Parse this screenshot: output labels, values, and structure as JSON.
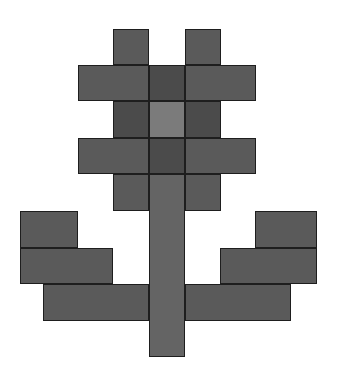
{
  "figure": {
    "background": "#ffffff",
    "colors": {
      "standard": "#5a5a5a",
      "dark": "#4b4b4b",
      "light_center": "#7b7b7b",
      "stem": "#646464",
      "outline": "#1e1e1e"
    },
    "blocks": [
      {
        "name": "petal-top-left",
        "x": 113,
        "y": 29,
        "w": 36,
        "h": 36,
        "tone": "standard"
      },
      {
        "name": "petal-top-right",
        "x": 185,
        "y": 29,
        "w": 36,
        "h": 36,
        "tone": "standard"
      },
      {
        "name": "petal-upper-left",
        "x": 78,
        "y": 65,
        "w": 71,
        "h": 36,
        "tone": "standard"
      },
      {
        "name": "petal-upper-center",
        "x": 149,
        "y": 65,
        "w": 36,
        "h": 36,
        "tone": "dark"
      },
      {
        "name": "petal-upper-right",
        "x": 185,
        "y": 65,
        "w": 71,
        "h": 36,
        "tone": "standard"
      },
      {
        "name": "petal-mid-left",
        "x": 113,
        "y": 101,
        "w": 36,
        "h": 37,
        "tone": "dark"
      },
      {
        "name": "flower-center",
        "x": 149,
        "y": 101,
        "w": 36,
        "h": 37,
        "tone": "light_center"
      },
      {
        "name": "petal-mid-right",
        "x": 185,
        "y": 101,
        "w": 36,
        "h": 37,
        "tone": "dark"
      },
      {
        "name": "petal-lower-left",
        "x": 78,
        "y": 138,
        "w": 71,
        "h": 36,
        "tone": "standard"
      },
      {
        "name": "petal-lower-center",
        "x": 149,
        "y": 138,
        "w": 36,
        "h": 36,
        "tone": "dark"
      },
      {
        "name": "petal-lower-right",
        "x": 185,
        "y": 138,
        "w": 71,
        "h": 36,
        "tone": "standard"
      },
      {
        "name": "petal-bottom-left",
        "x": 113,
        "y": 174,
        "w": 36,
        "h": 37,
        "tone": "standard"
      },
      {
        "name": "petal-bottom-right",
        "x": 185,
        "y": 174,
        "w": 36,
        "h": 37,
        "tone": "standard"
      },
      {
        "name": "stem",
        "x": 149,
        "y": 174,
        "w": 36,
        "h": 183,
        "tone": "stem"
      },
      {
        "name": "leaf-left-top",
        "x": 20,
        "y": 211,
        "w": 58,
        "h": 37,
        "tone": "standard"
      },
      {
        "name": "leaf-left-middle",
        "x": 20,
        "y": 248,
        "w": 93,
        "h": 36,
        "tone": "standard"
      },
      {
        "name": "leaf-left-bottom",
        "x": 43,
        "y": 284,
        "w": 106,
        "h": 37,
        "tone": "standard"
      },
      {
        "name": "leaf-right-top",
        "x": 255,
        "y": 211,
        "w": 62,
        "h": 37,
        "tone": "standard"
      },
      {
        "name": "leaf-right-middle",
        "x": 220,
        "y": 248,
        "w": 97,
        "h": 36,
        "tone": "standard"
      },
      {
        "name": "leaf-right-bottom",
        "x": 185,
        "y": 284,
        "w": 106,
        "h": 37,
        "tone": "standard"
      }
    ]
  }
}
